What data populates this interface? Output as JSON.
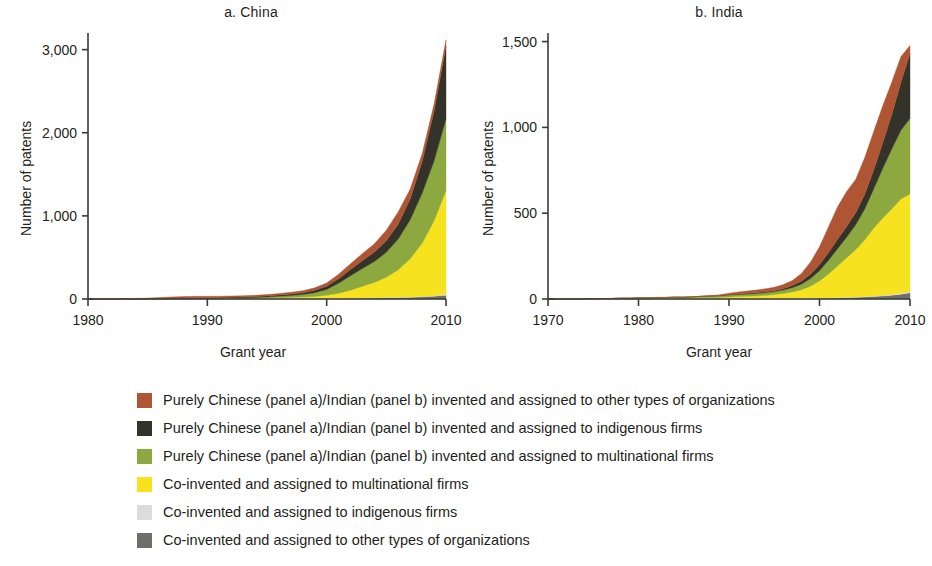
{
  "figure": {
    "panels": [
      {
        "id": "china",
        "title": "a. China",
        "xlabel": "Grant year",
        "ylabel": "Number of patents",
        "xticks": [
          "1980",
          "1990",
          "2000",
          "2010"
        ],
        "yticks": [
          "0",
          "1,000",
          "2,000",
          "3,000"
        ]
      },
      {
        "id": "india",
        "title": "b. India",
        "xlabel": "Grant year",
        "ylabel": "Number of patents",
        "xticks": [
          "1970",
          "1980",
          "1990",
          "2000",
          "2010"
        ],
        "yticks": [
          "0",
          "500",
          "1,000",
          "1,500"
        ]
      }
    ]
  },
  "legend": {
    "items": [
      {
        "color": "#b05533",
        "label": "Purely Chinese (panel a)/Indian (panel b) invented and assigned to other types of organizations"
      },
      {
        "color": "#34332a",
        "label": "Purely Chinese (panel a)/Indian (panel b) invented and assigned to indigenous firms"
      },
      {
        "color": "#8ca83e",
        "label": "Purely Chinese (panel a)/Indian (panel b) invented and assigned to multinational firms"
      },
      {
        "color": "#f7e220",
        "label": "Co-invented and assigned to multinational firms"
      },
      {
        "color": "#dcdcda",
        "label": "Co-invented and assigned to indigenous firms"
      },
      {
        "color": "#6e6e6a",
        "label": "Co-invented and assigned to other types of organizations"
      }
    ]
  },
  "chart_data": [
    {
      "type": "area",
      "id": "china",
      "title": "a. China",
      "xlabel": "Grant year",
      "ylabel": "Number of patents",
      "xlim": [
        1980,
        2010
      ],
      "ylim": [
        0,
        3200
      ],
      "yticks": [
        0,
        1000,
        2000,
        3000
      ],
      "xticks": [
        1980,
        1990,
        2000,
        2010
      ],
      "grid": false,
      "stacked": true,
      "stack_order_bottom_to_top": [
        "Co-invented and assigned to other types of organizations",
        "Co-invented and assigned to indigenous firms",
        "Co-invented and assigned to multinational firms",
        "Purely Chinese invented and assigned to multinational firms",
        "Purely Chinese invented and assigned to indigenous firms",
        "Purely Chinese invented and assigned to other types of organizations"
      ],
      "x": [
        1980,
        1981,
        1982,
        1983,
        1984,
        1985,
        1986,
        1987,
        1988,
        1989,
        1990,
        1991,
        1992,
        1993,
        1994,
        1995,
        1996,
        1997,
        1998,
        1999,
        2000,
        2001,
        2002,
        2003,
        2004,
        2005,
        2006,
        2007,
        2008,
        2009,
        2010
      ],
      "series": [
        {
          "name": "Co-invented and assigned to other types of organizations",
          "color": "#6e6e6a",
          "values": [
            0,
            0,
            0,
            0,
            0,
            0,
            0,
            1,
            1,
            1,
            1,
            1,
            2,
            2,
            2,
            3,
            3,
            4,
            4,
            5,
            6,
            7,
            8,
            10,
            12,
            14,
            17,
            20,
            26,
            34,
            46
          ]
        },
        {
          "name": "Co-invented and assigned to indigenous firms",
          "color": "#dcdcda",
          "values": [
            0,
            0,
            0,
            0,
            0,
            0,
            0,
            0,
            0,
            0,
            0,
            0,
            0,
            0,
            0,
            0,
            1,
            1,
            1,
            1,
            1,
            2,
            2,
            2,
            3,
            3,
            4,
            4,
            5,
            6,
            8
          ]
        },
        {
          "name": "Co-invented and assigned to multinational firms",
          "color": "#f7e220",
          "values": [
            0,
            0,
            0,
            0,
            0,
            0,
            0,
            1,
            1,
            2,
            2,
            3,
            4,
            5,
            6,
            8,
            11,
            14,
            18,
            25,
            38,
            60,
            95,
            140,
            185,
            245,
            330,
            460,
            640,
            900,
            1250
          ]
        },
        {
          "name": "Purely Chinese invented and assigned to multinational firms",
          "color": "#8ca83e",
          "values": [
            0,
            0,
            0,
            0,
            0,
            0,
            1,
            1,
            2,
            3,
            4,
            5,
            6,
            8,
            10,
            13,
            17,
            22,
            30,
            45,
            70,
            120,
            175,
            215,
            250,
            300,
            370,
            470,
            600,
            720,
            860
          ]
        },
        {
          "name": "Purely Chinese invented and assigned to indigenous firms",
          "color": "#34332a",
          "values": [
            0,
            0,
            0,
            1,
            1,
            2,
            3,
            5,
            7,
            8,
            9,
            9,
            10,
            11,
            12,
            13,
            15,
            18,
            22,
            28,
            38,
            55,
            75,
            95,
            115,
            140,
            180,
            250,
            380,
            600,
            880
          ]
        },
        {
          "name": "Purely Chinese invented and assigned to other types of organizations",
          "color": "#b05533",
          "values": [
            0,
            1,
            2,
            4,
            6,
            9,
            13,
            17,
            19,
            18,
            16,
            15,
            14,
            14,
            15,
            16,
            18,
            21,
            25,
            30,
            40,
            55,
            70,
            85,
            100,
            125,
            150,
            120,
            95,
            85,
            75
          ]
        }
      ],
      "total_2010": 3119
    },
    {
      "type": "area",
      "id": "india",
      "title": "b. India",
      "xlabel": "Grant year",
      "ylabel": "Number of patents",
      "xlim": [
        1970,
        2010
      ],
      "ylim": [
        0,
        1550
      ],
      "yticks": [
        0,
        500,
        1000,
        1500
      ],
      "xticks": [
        1970,
        1980,
        1990,
        2000,
        2010
      ],
      "grid": false,
      "stacked": true,
      "stack_order_bottom_to_top": [
        "Co-invented and assigned to other types of organizations",
        "Co-invented and assigned to indigenous firms",
        "Co-invented and assigned to multinational firms",
        "Purely Indian invented and assigned to multinational firms",
        "Purely Indian invented and assigned to indigenous firms",
        "Purely Indian invented and assigned to other types of organizations"
      ],
      "x": [
        1970,
        1971,
        1972,
        1973,
        1974,
        1975,
        1976,
        1977,
        1978,
        1979,
        1980,
        1981,
        1982,
        1983,
        1984,
        1985,
        1986,
        1987,
        1988,
        1989,
        1990,
        1991,
        1992,
        1993,
        1994,
        1995,
        1996,
        1997,
        1998,
        1999,
        2000,
        2001,
        2002,
        2003,
        2004,
        2005,
        2006,
        2007,
        2008,
        2009,
        2010
      ],
      "series": [
        {
          "name": "Co-invented and assigned to other types of organizations",
          "color": "#6e6e6a",
          "values": [
            0,
            0,
            0,
            0,
            0,
            0,
            0,
            0,
            0,
            0,
            0,
            0,
            0,
            0,
            0,
            0,
            0,
            0,
            0,
            0,
            1,
            1,
            1,
            1,
            1,
            2,
            2,
            2,
            3,
            3,
            4,
            5,
            6,
            8,
            10,
            12,
            15,
            18,
            22,
            28,
            36
          ]
        },
        {
          "name": "Co-invented and assigned to indigenous firms",
          "color": "#dcdcda",
          "values": [
            0,
            0,
            0,
            0,
            0,
            0,
            0,
            0,
            0,
            0,
            0,
            0,
            0,
            0,
            0,
            0,
            0,
            0,
            0,
            0,
            0,
            0,
            0,
            0,
            0,
            0,
            0,
            1,
            1,
            1,
            1,
            1,
            2,
            2,
            2,
            3,
            3,
            4,
            4,
            5,
            6
          ]
        },
        {
          "name": "Co-invented and assigned to multinational firms",
          "color": "#f7e220",
          "values": [
            0,
            0,
            0,
            0,
            0,
            1,
            1,
            1,
            2,
            2,
            3,
            3,
            4,
            4,
            5,
            5,
            6,
            7,
            8,
            9,
            11,
            13,
            15,
            17,
            20,
            24,
            30,
            38,
            50,
            70,
            100,
            140,
            185,
            230,
            275,
            330,
            395,
            450,
            500,
            550,
            570
          ]
        },
        {
          "name": "Purely Indian invented and assigned to multinational firms",
          "color": "#8ca83e",
          "values": [
            0,
            0,
            0,
            0,
            0,
            1,
            2,
            2,
            3,
            3,
            4,
            4,
            5,
            5,
            6,
            6,
            7,
            8,
            9,
            10,
            11,
            12,
            13,
            14,
            15,
            17,
            20,
            25,
            32,
            45,
            60,
            80,
            100,
            120,
            145,
            180,
            230,
            290,
            350,
            400,
            440
          ]
        },
        {
          "name": "Purely Indian invented and assigned to indigenous firms",
          "color": "#34332a",
          "values": [
            0,
            0,
            0,
            0,
            0,
            0,
            0,
            0,
            0,
            0,
            0,
            0,
            0,
            0,
            0,
            0,
            0,
            1,
            1,
            2,
            3,
            3,
            4,
            4,
            5,
            6,
            8,
            12,
            18,
            25,
            35,
            45,
            55,
            62,
            70,
            85,
            110,
            150,
            200,
            280,
            380
          ]
        },
        {
          "name": "Purely Indian invented and assigned to other types of organizations",
          "color": "#b05533",
          "values": [
            0,
            0,
            0,
            0,
            0,
            0,
            0,
            0,
            0,
            0,
            0,
            0,
            0,
            0,
            0,
            0,
            0,
            1,
            2,
            4,
            8,
            12,
            14,
            16,
            18,
            20,
            24,
            30,
            45,
            70,
            105,
            150,
            190,
            205,
            195,
            215,
            225,
            215,
            190,
            150,
            45
          ]
        }
      ],
      "total_2010": 1477
    }
  ]
}
